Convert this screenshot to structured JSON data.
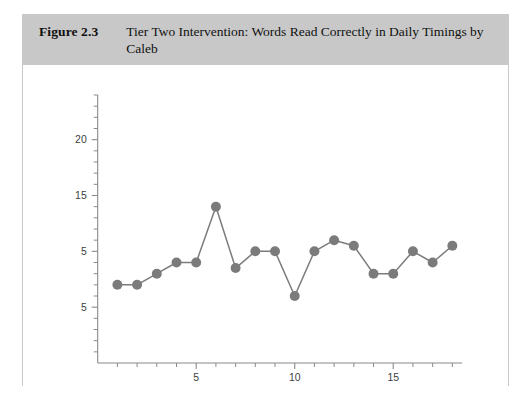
{
  "figure": {
    "number": "Figure 2.3",
    "title": "Tier Two Intervention: Words Read Correctly in Daily Timings by Caleb"
  },
  "colors": {
    "header_band": "#c8c8c8",
    "card_border": "#c9c9c9",
    "axis": "#8a8a8a",
    "series": "#7b7b7b",
    "page_background": "#ffffff"
  },
  "chart_data": {
    "type": "line",
    "title": "Tier Two Intervention: Words Read Correctly in Daily Timings by Caleb",
    "xlabel": "",
    "ylabel": "",
    "grid": false,
    "legend": false,
    "x": [
      1,
      2,
      3,
      4,
      5,
      6,
      7,
      8,
      9,
      10,
      11,
      12,
      13,
      14,
      15,
      16,
      17,
      18
    ],
    "values": [
      7,
      7,
      8,
      9,
      9,
      14,
      8.5,
      10,
      10,
      6,
      10,
      11,
      10.5,
      8,
      8,
      10,
      9,
      10.5
    ],
    "series": [
      {
        "name": "Words read correctly",
        "values": [
          7,
          7,
          8,
          9,
          9,
          14,
          8.5,
          10,
          10,
          6,
          10,
          11,
          10.5,
          8,
          8,
          10,
          9,
          10.5
        ]
      }
    ],
    "xlim": [
      0,
      18.5
    ],
    "ylim": [
      0,
      24
    ],
    "x_tick_values": [
      5,
      10,
      15
    ],
    "x_tick_labels": [
      "5",
      "10",
      "15"
    ],
    "x_minor_tick_values": [
      1,
      2,
      3,
      4,
      6,
      7,
      8,
      9,
      11,
      12,
      13,
      14,
      16,
      17,
      18
    ],
    "y_tick_values": [
      5,
      10,
      15,
      20
    ],
    "y_tick_labels": [
      "5",
      "5",
      "15",
      "20"
    ],
    "marker": "circle",
    "marker_size": 5
  }
}
